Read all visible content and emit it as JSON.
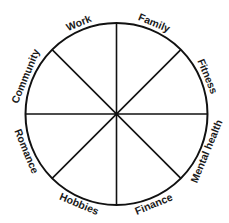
{
  "diagram": {
    "type": "wheel",
    "center": [
      116.5,
      114
    ],
    "radius": 91,
    "stroke_color": "#111111",
    "background": "#ffffff",
    "spokes": 8,
    "segments": [
      {
        "label": "Family",
        "angle_deg": -67.5
      },
      {
        "label": "Fitness",
        "angle_deg": -22.5
      },
      {
        "label": "Mental health",
        "angle_deg": 22.5
      },
      {
        "label": "Finance",
        "angle_deg": 67.5
      },
      {
        "label": "Hobbies",
        "angle_deg": 112.5
      },
      {
        "label": "Romance",
        "angle_deg": 157.5
      },
      {
        "label": "Community",
        "angle_deg": 202.5
      },
      {
        "label": "Work",
        "angle_deg": 247.5
      }
    ]
  }
}
